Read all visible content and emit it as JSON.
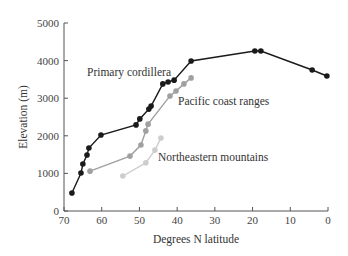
{
  "chart_data": {
    "type": "line",
    "title": "",
    "xlabel": "Degrees N latitude",
    "ylabel": "Elevation (m)",
    "xlim": [
      70,
      0
    ],
    "ylim": [
      0,
      5000
    ],
    "x_ticks": [
      70,
      60,
      50,
      40,
      30,
      20,
      10,
      0
    ],
    "y_ticks": [
      0,
      1000,
      2000,
      3000,
      4000,
      5000
    ],
    "grid": false,
    "legend": "inline labels",
    "series": [
      {
        "name": "Primary cordillera",
        "color": "#1a1a1a",
        "label_pos": [
          87,
          76
        ],
        "points": [
          [
            67.9,
            480
          ],
          [
            65.5,
            1010
          ],
          [
            65.0,
            1250
          ],
          [
            63.9,
            1490
          ],
          [
            63.4,
            1675
          ],
          [
            60.2,
            2020
          ],
          [
            50.9,
            2290
          ],
          [
            49.9,
            2450
          ],
          [
            47.5,
            2710
          ],
          [
            46.9,
            2790
          ],
          [
            43.8,
            3380
          ],
          [
            42.4,
            3430
          ],
          [
            40.8,
            3480
          ],
          [
            36.3,
            3990
          ],
          [
            19.4,
            4255
          ],
          [
            17.8,
            4255
          ],
          [
            4.2,
            3750
          ],
          [
            0.3,
            3590
          ]
        ]
      },
      {
        "name": "Pacific coast ranges",
        "color": "#a0a0a0",
        "label_pos": [
          178,
          105
        ],
        "points": [
          [
            63.1,
            1060
          ],
          [
            52.5,
            1460
          ],
          [
            49.6,
            1755
          ],
          [
            48.3,
            2130
          ],
          [
            47.7,
            2310
          ],
          [
            41.9,
            3060
          ],
          [
            40.3,
            3190
          ],
          [
            38.2,
            3380
          ],
          [
            36.3,
            3540
          ]
        ]
      },
      {
        "name": "Northeastern mountains",
        "color": "#cdcdcd",
        "label_pos": [
          158,
          161
        ],
        "points": [
          [
            54.4,
            930
          ],
          [
            48.3,
            1280
          ],
          [
            45.9,
            1620
          ],
          [
            44.3,
            1940
          ]
        ]
      }
    ]
  },
  "axes": {
    "x_title": "Degrees N latitude",
    "y_title": "Elevation (m)"
  }
}
